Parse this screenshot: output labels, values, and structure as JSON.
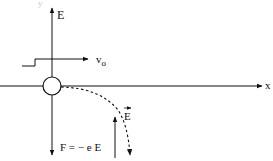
{
  "diagram": {
    "axes": {
      "vertical_label": "y",
      "horizontal_label": "x"
    },
    "labels": {
      "field_up": "E",
      "velocity": "v",
      "velocity_sub": "o",
      "force": "F = − e E",
      "field_vector": "E"
    },
    "elements": {
      "particle": "electron (circle at origin)",
      "trajectory": "dashed parabolic path curving downward",
      "field_arrow": "upward arrow labeled E vector"
    },
    "colors": {
      "stroke": "#111111",
      "background": "#ffffff"
    }
  }
}
